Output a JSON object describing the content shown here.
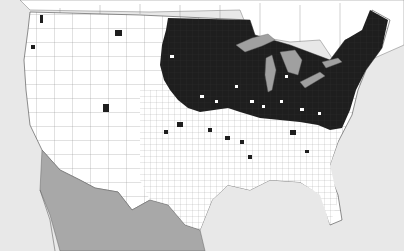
{
  "map": {
    "type": "county distribution map",
    "region": "United States (lower 48), southern Canada, northern Mexico",
    "legend": [],
    "colors": {
      "ocean": "#e8e8e8",
      "us_county_fill": "#ffffff",
      "present_county": "#1a1a1a",
      "mexico": "#a8a8a8",
      "great_lakes": "#a0a0a0",
      "boundaries": "#555555"
    },
    "distribution_summary": "Present across the Midwest, Great Lakes, Northeast and Appalachians; scattered outliers in the Plains, Mountain West and Pacific Northwest"
  }
}
